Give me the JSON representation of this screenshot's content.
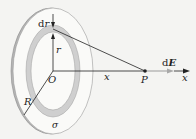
{
  "figure": {
    "labels": {
      "dr": "dr",
      "d": "d",
      "r_var": "r",
      "r": "r",
      "O": "O",
      "x_dist": "x",
      "P": "P",
      "dE_d": "d",
      "dE_E": "E",
      "x_axis": "x",
      "R": "R",
      "sigma": "σ"
    },
    "colors": {
      "background": "#f4f4f2",
      "disk_fill": "#fafaf8",
      "disk_edge": "#9a9a9a",
      "ring_fill": "#cfcfcf",
      "line": "#222222",
      "dE_arrow": "#a8a8a8"
    }
  }
}
